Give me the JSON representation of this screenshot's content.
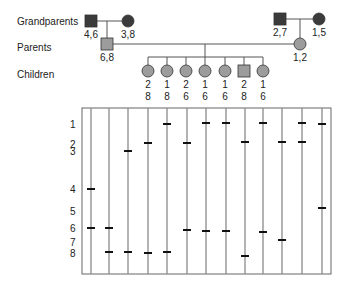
{
  "generation_labels": {
    "grandparents": "Grandparents",
    "parents": "Parents",
    "children": "Children"
  },
  "colors": {
    "dark_fill": "#3b3b3b",
    "gray_fill": "#9c9c9c",
    "line": "#555555",
    "lane": "#8a8a8a",
    "band": "#111111"
  },
  "pedigree": {
    "paternal_grandfather": {
      "shape": "square",
      "genotype": "4,6",
      "x": 91,
      "y": 21,
      "fill": "dark"
    },
    "paternal_grandmother": {
      "shape": "circle",
      "genotype": "3,8",
      "x": 128,
      "y": 21,
      "fill": "dark"
    },
    "father": {
      "shape": "square",
      "genotype": "6,8",
      "x": 107,
      "y": 44,
      "fill": "gray"
    },
    "maternal_grandfather": {
      "shape": "square",
      "genotype": "2,7",
      "x": 280,
      "y": 19,
      "fill": "dark"
    },
    "maternal_grandmother": {
      "shape": "circle",
      "genotype": "1,5",
      "x": 319,
      "y": 19,
      "fill": "dark"
    },
    "mother": {
      "shape": "circle",
      "genotype": "1,2",
      "x": 300,
      "y": 44,
      "fill": "gray"
    },
    "children": [
      {
        "shape": "circle",
        "allele_top": "2",
        "allele_bottom": "8",
        "x": 148
      },
      {
        "shape": "circle",
        "allele_top": "1",
        "allele_bottom": "8",
        "x": 167
      },
      {
        "shape": "circle",
        "allele_top": "2",
        "allele_bottom": "6",
        "x": 186
      },
      {
        "shape": "circle",
        "allele_top": "1",
        "allele_bottom": "6",
        "x": 205
      },
      {
        "shape": "circle",
        "allele_top": "1",
        "allele_bottom": "6",
        "x": 225
      },
      {
        "shape": "square",
        "allele_top": "2",
        "allele_bottom": "8",
        "x": 244
      },
      {
        "shape": "circle",
        "allele_top": "1",
        "allele_bottom": "6",
        "x": 263
      }
    ]
  },
  "gel": {
    "band_labels": [
      {
        "label": "1",
        "y": 125
      },
      {
        "label": "2",
        "y": 145
      },
      {
        "label": "3",
        "y": 152
      },
      {
        "label": "4",
        "y": 190
      },
      {
        "label": "5",
        "y": 212
      },
      {
        "label": "6",
        "y": 229
      },
      {
        "label": "7",
        "y": 243
      },
      {
        "label": "8",
        "y": 254
      }
    ],
    "lanes": [
      {
        "x": 91,
        "bands": [
          {
            "pos": "4",
            "y": 189
          },
          {
            "pos": "6",
            "y": 228
          }
        ]
      },
      {
        "x": 109,
        "bands": [
          {
            "pos": "6",
            "y": 228
          },
          {
            "pos": "8",
            "y": 252
          }
        ]
      },
      {
        "x": 128,
        "bands": [
          {
            "pos": "3",
            "y": 151
          },
          {
            "pos": "8",
            "y": 252
          }
        ]
      },
      {
        "x": 148,
        "bands": [
          {
            "pos": "2",
            "y": 143
          },
          {
            "pos": "8",
            "y": 253
          }
        ]
      },
      {
        "x": 167,
        "bands": [
          {
            "pos": "1",
            "y": 124
          },
          {
            "pos": "8",
            "y": 252
          }
        ]
      },
      {
        "x": 187,
        "bands": [
          {
            "pos": "2",
            "y": 143
          },
          {
            "pos": "6",
            "y": 230
          }
        ]
      },
      {
        "x": 206,
        "bands": [
          {
            "pos": "1",
            "y": 123
          },
          {
            "pos": "6",
            "y": 231
          }
        ]
      },
      {
        "x": 226,
        "bands": [
          {
            "pos": "1",
            "y": 123
          },
          {
            "pos": "6",
            "y": 231
          }
        ]
      },
      {
        "x": 245,
        "bands": [
          {
            "pos": "2",
            "y": 142
          },
          {
            "pos": "8",
            "y": 256
          }
        ]
      },
      {
        "x": 263,
        "bands": [
          {
            "pos": "1",
            "y": 123
          },
          {
            "pos": "6",
            "y": 232
          }
        ]
      },
      {
        "x": 282,
        "bands": [
          {
            "pos": "2",
            "y": 142
          },
          {
            "pos": "7",
            "y": 240
          }
        ]
      },
      {
        "x": 302,
        "bands": [
          {
            "pos": "1",
            "y": 123
          },
          {
            "pos": "2",
            "y": 142
          }
        ]
      },
      {
        "x": 322,
        "bands": [
          {
            "pos": "1",
            "y": 124
          },
          {
            "pos": "5",
            "y": 208
          }
        ]
      }
    ]
  }
}
